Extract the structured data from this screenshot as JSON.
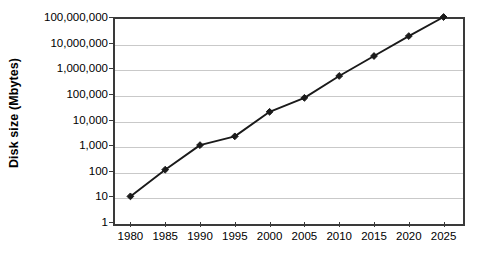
{
  "chart_data": {
    "type": "line",
    "title": "",
    "xlabel": "",
    "ylabel": "Disk size (Mbytes)",
    "yscale": "log",
    "ylim": [
      1,
      100000000
    ],
    "xlim": [
      1980,
      2025
    ],
    "grid": true,
    "legend": false,
    "legend_position": "none",
    "marker": "diamond",
    "line_color": "#1a1a1a",
    "grid_color": "#c9c9c9",
    "axis_color": "#3a3a3a",
    "background_color": "#ffffff",
    "y_ticks": [
      "100,000,000",
      "10,000,000",
      "1,000,000",
      "100,000",
      "10,000",
      "1,000",
      "100",
      "10",
      "1"
    ],
    "y_tick_values": [
      100000000,
      10000000,
      1000000,
      100000,
      10000,
      1000,
      100,
      10,
      1
    ],
    "x_ticks": [
      "1980",
      "1985",
      "1990",
      "1995",
      "2000",
      "2005",
      "2010",
      "2015",
      "2020",
      "2025"
    ],
    "x": [
      1980,
      1985,
      1990,
      1995,
      2000,
      2005,
      2010,
      2015,
      2020,
      2025
    ],
    "values": [
      10,
      110,
      1000,
      2200,
      20000,
      70000,
      500000,
      3000000,
      18000000,
      100000000
    ],
    "series": [
      {
        "name": "Disk size",
        "values": [
          10,
          110,
          1000,
          2200,
          20000,
          70000,
          500000,
          3000000,
          18000000,
          100000000
        ]
      }
    ]
  }
}
